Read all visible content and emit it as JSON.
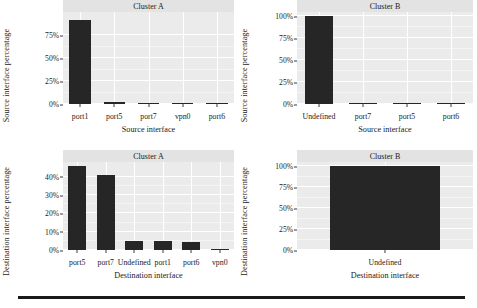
{
  "figure": {
    "background_color": "#ffffff",
    "panel_color": "#ebebeb",
    "strip_color": "#e3e3e3",
    "bar_color": "#262626",
    "gridline_color": "#ffffff",
    "rule_color": "#1a1a1a"
  },
  "chart_data": [
    {
      "id": "source-cluster-a",
      "type": "bar",
      "title": "Cluster A",
      "xlabel": "Source interface",
      "ylabel": "Source interface percentage",
      "categories": [
        "port1",
        "port5",
        "port7",
        "vpn0",
        "port6"
      ],
      "values": [
        91,
        2,
        1.5,
        1.5,
        0.8
      ],
      "ylim": [
        0,
        100
      ],
      "yticks": [
        0,
        25,
        50,
        75
      ],
      "yticklabels": [
        "0%",
        "25%",
        "50%",
        "75%"
      ],
      "grid": true,
      "legend": "none"
    },
    {
      "id": "source-cluster-b",
      "type": "bar",
      "title": "Cluster B",
      "xlabel": "Source interface",
      "ylabel": "Source interface percentage",
      "categories": [
        "Undefined",
        "port7",
        "port5",
        "port6"
      ],
      "values": [
        100,
        0.8,
        0.6,
        0.2
      ],
      "ylim": [
        0,
        105
      ],
      "yticks": [
        0,
        25,
        50,
        75,
        100
      ],
      "yticklabels": [
        "0%",
        "25%",
        "50%",
        "75%",
        "100%"
      ],
      "grid": true,
      "legend": "none"
    },
    {
      "id": "destination-cluster-a",
      "type": "bar",
      "title": "Cluster A",
      "xlabel": "Destination interface",
      "ylabel": "Destination interface percentage",
      "categories": [
        "port5",
        "port7",
        "Undefined",
        "port1",
        "port6",
        "vpn0"
      ],
      "values": [
        46,
        41,
        5,
        4.8,
        4.2,
        0.6
      ],
      "ylim": [
        0,
        48
      ],
      "yticks": [
        0,
        10,
        20,
        30,
        40
      ],
      "yticklabels": [
        "0%",
        "10%",
        "20%",
        "30%",
        "40%"
      ],
      "grid": true,
      "legend": "none"
    },
    {
      "id": "destination-cluster-b",
      "type": "bar",
      "title": "Cluster B",
      "xlabel": "Destination interface",
      "ylabel": "Destination interface percentage",
      "categories": [
        "Undefined"
      ],
      "values": [
        100
      ],
      "ylim": [
        0,
        105
      ],
      "yticks": [
        0,
        25,
        50,
        75,
        100
      ],
      "yticklabels": [
        "0%",
        "25%",
        "50%",
        "75%",
        "100%"
      ],
      "grid": true,
      "legend": "none"
    }
  ]
}
